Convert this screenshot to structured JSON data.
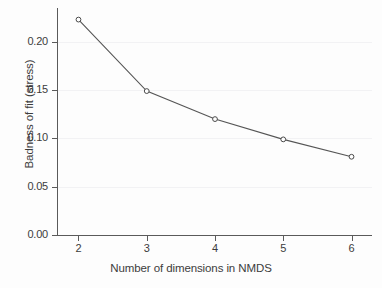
{
  "chart_data": {
    "type": "line",
    "title": "",
    "subtitle": "",
    "xlabel": "Number of dimensions in NMDS",
    "ylabel": "Badness of fit (stress)",
    "x": [
      2,
      3,
      4,
      5,
      6
    ],
    "values": [
      0.223,
      0.149,
      0.12,
      0.099,
      0.081
    ],
    "series": [
      {
        "name": "stress",
        "x": [
          2,
          3,
          4,
          5,
          6
        ],
        "values": [
          0.223,
          0.149,
          0.12,
          0.099,
          0.081
        ]
      }
    ],
    "xlim": [
      1.7,
      6.3
    ],
    "ylim": [
      0.0,
      0.235
    ],
    "xticks": [
      2,
      3,
      4,
      5,
      6
    ],
    "xticklabels": [
      "2",
      "3",
      "4",
      "5",
      "6"
    ],
    "yticks": [
      0.0,
      0.05,
      0.1,
      0.15,
      0.2
    ],
    "yticklabels": [
      "0.00",
      "0.05",
      "0.10",
      "0.15",
      "0.20"
    ],
    "grid": "horizontal",
    "legend": "none",
    "marker": "open-circle",
    "line_color": "#555555",
    "marker_color": "#4a4a4a",
    "grid_color": "#f2f2f4",
    "axis_color": "#5a5a5a",
    "background_color": "#fdfdfd",
    "annotations": []
  }
}
